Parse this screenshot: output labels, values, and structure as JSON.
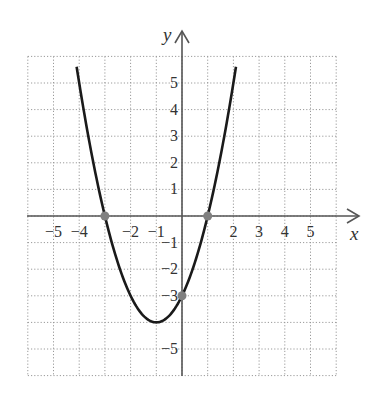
{
  "chart_data": {
    "type": "line",
    "title": "",
    "xlabel": "x",
    "ylabel": "y",
    "xlim": [
      -6,
      6
    ],
    "ylim": [
      -6,
      6
    ],
    "grid": true,
    "equation": "y = x^2 + 2x - 3",
    "x_tick_labels": [
      "−5",
      "−4",
      "−2",
      "−1",
      "2",
      "3",
      "4",
      "5"
    ],
    "x_tick_values": [
      -5,
      -4,
      -2,
      -1,
      2,
      3,
      4,
      5
    ],
    "y_tick_labels": [
      "5",
      "4",
      "3",
      "2",
      "1",
      "−1",
      "−2",
      "−3",
      "−5"
    ],
    "y_tick_values": [
      5,
      4,
      3,
      2,
      1,
      -1,
      -2,
      -3,
      -5
    ],
    "series": [
      {
        "name": "parabola",
        "x": [
          -4.1,
          -4,
          -3.5,
          -3,
          -2.5,
          -2,
          -1.5,
          -1,
          -0.5,
          0,
          0.5,
          1,
          1.5,
          2,
          2.1
        ],
        "y": [
          5.61,
          5,
          2.25,
          0,
          -1.75,
          -3,
          -3.75,
          -4,
          -3.75,
          -3,
          -1.75,
          0,
          2.25,
          5,
          5.61
        ]
      }
    ],
    "highlighted_points": [
      {
        "label": "x-intercept",
        "x": -3,
        "y": 0
      },
      {
        "label": "x-intercept",
        "x": 1,
        "y": 0
      },
      {
        "label": "y-intercept",
        "x": 0,
        "y": -3
      }
    ],
    "vertex": {
      "x": -1,
      "y": -4
    },
    "colors": {
      "curve": "#1a1a1a",
      "points": "#808080",
      "grid": "#9a9a9a",
      "axes": "#444444"
    }
  }
}
